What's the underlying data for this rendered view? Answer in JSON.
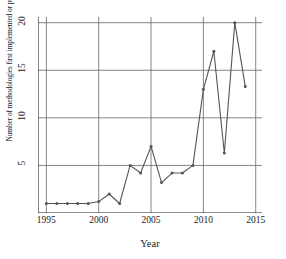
{
  "chart_data": {
    "type": "line",
    "title": "",
    "xlabel": "Year",
    "ylabel": "Number of methodologies first implemented or published",
    "xlim": [
      1994.2,
      2015.6
    ],
    "ylim": [
      0,
      20.6
    ],
    "grid": true,
    "legend": null,
    "line_color": "#555555",
    "marker": "circle",
    "x": [
      1995,
      1996,
      1997,
      1998,
      1999,
      2000,
      2001,
      2002,
      2003,
      2004,
      2005,
      2006,
      2007,
      2008,
      2009,
      2010,
      2011,
      2012,
      2013,
      2014
    ],
    "values": [
      1,
      1,
      1,
      1,
      1,
      1.2,
      2,
      1,
      5,
      4.2,
      7,
      3.2,
      4.2,
      4.2,
      5,
      13,
      17,
      6.3,
      20,
      13.3
    ],
    "xticks": [
      1995,
      2000,
      2005,
      2010,
      2015
    ],
    "xticklabels": [
      "1995",
      "2000",
      "2005",
      "2010",
      "2015"
    ],
    "yticks": [
      5,
      10,
      15,
      20
    ],
    "yticklabels": [
      "5",
      "10",
      "15",
      "20"
    ]
  },
  "axes": {
    "x_label": "Year",
    "y_label": "Number of methodologies first implemented or published"
  }
}
